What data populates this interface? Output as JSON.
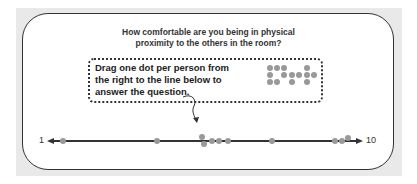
{
  "question": {
    "line1": "How comfortable are you being in physical",
    "line2": "proximity to the others in the room?"
  },
  "instruction": {
    "line1": "Drag one dot per person from",
    "line2": "the right to the line below to",
    "line3": "answer the question."
  },
  "scale": {
    "min_label": "1",
    "max_label": "10"
  },
  "colors": {
    "dot": "#999999",
    "line": "#333333",
    "frame": "#e9e9e9"
  },
  "palette_dots": [
    [
      270,
      68
    ],
    [
      277,
      68
    ],
    [
      284,
      68
    ],
    [
      307,
      68
    ],
    [
      270,
      75
    ],
    [
      284,
      75
    ],
    [
      292,
      75
    ],
    [
      299,
      75
    ],
    [
      307,
      75
    ],
    [
      314,
      75
    ],
    [
      270,
      82
    ],
    [
      277,
      82
    ],
    [
      292,
      82
    ],
    [
      307,
      82
    ]
  ],
  "placed_dots": [
    [
      63,
      141
    ],
    [
      157,
      141
    ],
    [
      202,
      137
    ],
    [
      204,
      144
    ],
    [
      212,
      141
    ],
    [
      219,
      141
    ],
    [
      228,
      141
    ],
    [
      272,
      141
    ],
    [
      335,
      141
    ],
    [
      342,
      141
    ],
    [
      348,
      138
    ]
  ]
}
